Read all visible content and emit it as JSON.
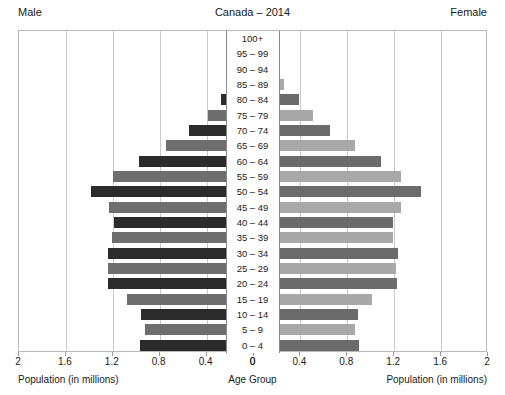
{
  "header": {
    "male_label": "Male",
    "female_label": "Female",
    "title": "Canada – 2014"
  },
  "footer": {
    "left_caption": "Population (in millions)",
    "center_caption": "Age Group",
    "right_caption": "Population (in millions)"
  },
  "axis": {
    "tick_labels": [
      "2",
      "1.6",
      "1.2",
      "0.8",
      "0.4",
      "0",
      "0",
      "0.4",
      "0.8",
      "1.2",
      "1.6",
      "2"
    ],
    "max_value": 2,
    "step": 0.4
  },
  "colors": {
    "male_dark": "#2b2b2b",
    "male_mid": "#6e6e6e",
    "female_dark": "#6b6b6b",
    "female_light": "#a8a8a8",
    "frame": "#b9b9b9",
    "grid": "#c9c9c9",
    "label_border": "#8a8a8a",
    "text": "#1a1a1a"
  },
  "chart_data": {
    "type": "bar",
    "title": "Canada – 2014",
    "subtitle": "",
    "xlabel": "Population (in millions)",
    "ylabel": "Age Group",
    "xlim": [
      -2,
      2
    ],
    "grid": true,
    "legend_position": "none",
    "annotations": [
      "Male",
      "Female"
    ],
    "categories": [
      "100+",
      "95 – 99",
      "90 – 94",
      "85 – 89",
      "80 – 84",
      "75 – 79",
      "70 – 74",
      "65 – 69",
      "60 – 64",
      "55 – 59",
      "50 – 54",
      "45 – 49",
      "40 – 44",
      "35 – 39",
      "30 – 34",
      "25 – 29",
      "20 – 24",
      "15 – 19",
      "10 – 14",
      "5 – 9",
      "0 – 4"
    ],
    "series": [
      {
        "name": "Male",
        "side": "left",
        "values": [
          0.005,
          0.035,
          0.09,
          0.17,
          0.27,
          0.38,
          0.54,
          0.74,
          0.97,
          1.19,
          1.38,
          1.22,
          1.18,
          1.2,
          1.23,
          1.23,
          1.23,
          1.07,
          0.95,
          0.92,
          0.96
        ]
      },
      {
        "name": "Female",
        "side": "right",
        "values": [
          0.012,
          0.065,
          0.155,
          0.27,
          0.4,
          0.52,
          0.66,
          0.87,
          1.1,
          1.27,
          1.44,
          1.27,
          1.2,
          1.2,
          1.24,
          1.22,
          1.23,
          1.02,
          0.9,
          0.87,
          0.91
        ]
      }
    ]
  }
}
